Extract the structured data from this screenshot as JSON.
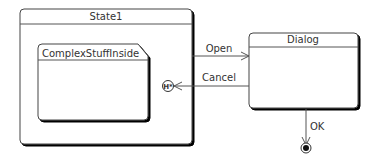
{
  "diagram": {
    "type": "UML state machine",
    "states": [
      {
        "id": "state1",
        "name": "State1"
      },
      {
        "id": "complex",
        "name": "ComplexStuffInside"
      },
      {
        "id": "dialog",
        "name": "Dialog"
      }
    ],
    "transitions": [
      {
        "from": "State1",
        "to": "Dialog",
        "label": "Open"
      },
      {
        "from": "Dialog",
        "to": "State1 deep history",
        "label": "Cancel"
      },
      {
        "from": "Dialog",
        "to": "final state",
        "label": "OK"
      }
    ],
    "history_icon": "H*"
  }
}
